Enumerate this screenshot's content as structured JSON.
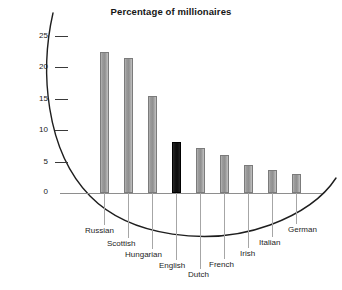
{
  "chart_data": {
    "type": "bar",
    "title": "Percentage of millionaires",
    "xlabel": "",
    "ylabel": "",
    "categories": [
      "Russian",
      "Scottish",
      "Hungarian",
      "English",
      "Dutch",
      "French",
      "Irish",
      "Italian",
      "German"
    ],
    "values": [
      22.5,
      21.5,
      15.4,
      8.1,
      7.1,
      6.0,
      4.4,
      3.7,
      3.0
    ],
    "ylim": [
      0,
      27
    ],
    "yticks": [
      0,
      5,
      10,
      15,
      20,
      25
    ],
    "ytick_labels": [
      "0",
      "5",
      "10",
      "15",
      "20",
      "25"
    ],
    "grid": false,
    "legend": "none",
    "highlight_category": "English",
    "colors": {
      "bar": "#9a9a9a",
      "bar_border": "#7b7b7b",
      "highlight_bar": "#111111",
      "axis": "#8e8e8e",
      "text": "#1a1a1a",
      "arc": "#1e1e1e",
      "background": "#ffffff"
    }
  },
  "axis": {
    "tick_25": "25",
    "tick_20": "20",
    "tick_15": "15",
    "tick_10": "10",
    "tick_5": "5",
    "tick_0": "0"
  },
  "labels": {
    "russian": "Russian",
    "scottish": "Scottish",
    "hungarian": "Hungarian",
    "english": "English",
    "dutch": "Dutch",
    "french": "French",
    "irish": "Irish",
    "italian": "Italian",
    "german": "German"
  }
}
